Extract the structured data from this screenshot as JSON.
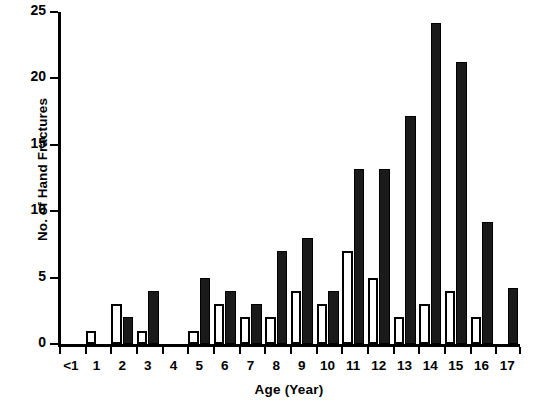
{
  "chart_data": {
    "type": "bar",
    "title": "",
    "xlabel": "Age (Year)",
    "ylabel": "No. of Hand Fractures",
    "categories": [
      "<1",
      "1",
      "2",
      "3",
      "4",
      "5",
      "6",
      "7",
      "8",
      "9",
      "10",
      "11",
      "12",
      "13",
      "14",
      "15",
      "16",
      "17"
    ],
    "series": [
      {
        "name": "open",
        "style": "hollow",
        "color": "#ffffff",
        "values": [
          0,
          1,
          3,
          1,
          0,
          1,
          3,
          2,
          2,
          4,
          3,
          7,
          5,
          2,
          3,
          4,
          2,
          0
        ]
      },
      {
        "name": "filled",
        "style": "solid",
        "color": "#1a1a1a",
        "values": [
          0,
          0,
          2,
          4,
          0,
          5,
          4,
          3,
          7,
          8,
          4,
          13.2,
          13.2,
          17.2,
          24.2,
          21.2,
          9.2,
          4.2
        ]
      }
    ],
    "ylim": [
      0,
      25
    ],
    "yticks": [
      0,
      5,
      10,
      15,
      20,
      25
    ],
    "ytick_labels": [
      "0",
      "5",
      "10",
      "15",
      "20",
      "25"
    ],
    "grid": false,
    "legend": "none"
  }
}
